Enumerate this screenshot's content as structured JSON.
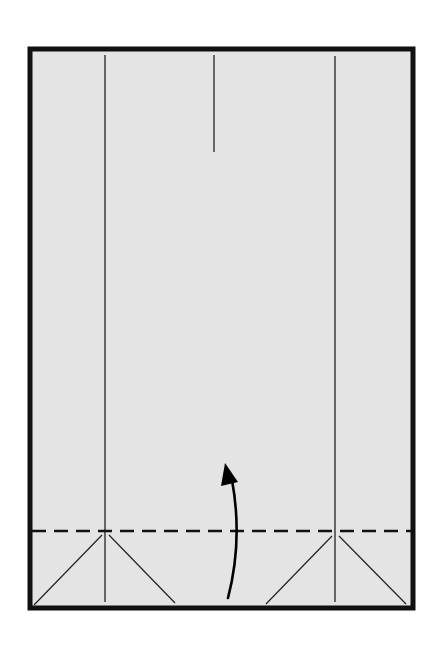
{
  "diagram": {
    "type": "origami-fold-step",
    "width": 445,
    "height": 645,
    "colors": {
      "background": "#ffffff",
      "paper": "#e4e4e4",
      "border": "#111111",
      "line": "#222222",
      "arrow": "#000000"
    },
    "paper": {
      "x": 30,
      "y": 49,
      "width": 383,
      "height": 559,
      "border_width": 5
    },
    "creases": [
      {
        "name": "left-vertical-crease",
        "x1": 105,
        "y1": 55,
        "x2": 105,
        "y2": 602
      },
      {
        "name": "center-top-crease",
        "x1": 214,
        "y1": 55,
        "x2": 214,
        "y2": 152
      },
      {
        "name": "right-vertical-crease",
        "x1": 335,
        "y1": 56,
        "x2": 335,
        "y2": 602
      }
    ],
    "diagonals": [
      {
        "name": "left-diagonal-1",
        "x1": 102,
        "y1": 535,
        "x2": 34,
        "y2": 605
      },
      {
        "name": "left-diagonal-2",
        "x1": 109,
        "y1": 535,
        "x2": 175,
        "y2": 603
      },
      {
        "name": "right-diagonal-1",
        "x1": 332,
        "y1": 536,
        "x2": 266,
        "y2": 604
      },
      {
        "name": "right-diagonal-2",
        "x1": 339,
        "y1": 536,
        "x2": 406,
        "y2": 604
      }
    ],
    "valley_fold": {
      "name": "valley-fold-line",
      "x1": 32,
      "y1": 531,
      "x2": 411,
      "y2": 531,
      "dash": "14 8"
    },
    "fold_arrow": {
      "name": "fold-up-arrow",
      "path": "M 228 598 Q 243 540 232 480",
      "head": "225,463 221,486 238,482"
    }
  }
}
